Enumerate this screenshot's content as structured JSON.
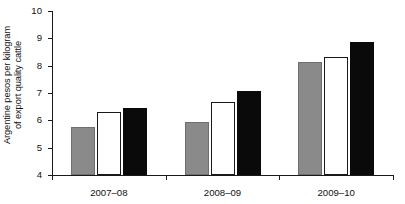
{
  "chart_data": {
    "type": "bar",
    "title": "",
    "xlabel": "",
    "ylabel_line1": "Argentine pesos per kilogram",
    "ylabel_line2": "of export quality cattle",
    "categories": [
      "2007–08",
      "2008–09",
      "2009–10"
    ],
    "series": [
      {
        "name": "series-1",
        "color": "#8a8a8a",
        "style": "gray-filled",
        "values": [
          5.75,
          5.95,
          8.15
        ]
      },
      {
        "name": "series-2",
        "color": "#ffffff",
        "style": "white-outlined",
        "values": [
          6.3,
          6.68,
          8.3
        ]
      },
      {
        "name": "series-3",
        "color": "#0a0a0a",
        "style": "black-filled",
        "values": [
          6.47,
          7.09,
          8.85
        ]
      }
    ],
    "ylim": [
      4,
      10
    ],
    "ytick_values": [
      4,
      5,
      6,
      7,
      8,
      9,
      10
    ],
    "ytick_labels": [
      "4",
      "5",
      "6",
      "7",
      "8",
      "9",
      "10"
    ],
    "grid": false,
    "legend": "none"
  },
  "colors": {
    "axis": "#1a1a1a",
    "gray_bar": "#8a8a8a",
    "gray_bar_edge": "#6f6f6f",
    "white_bar": "#ffffff",
    "white_bar_edge": "#1a1a1a",
    "black_bar": "#0a0a0a",
    "background": "#ffffff"
  }
}
